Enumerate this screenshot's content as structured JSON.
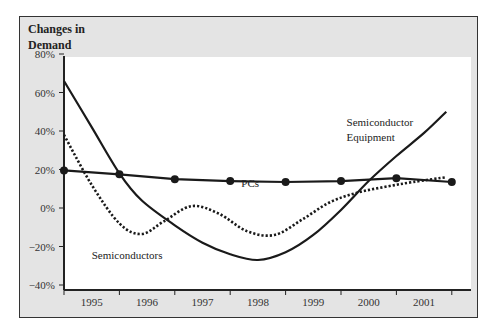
{
  "chart_data": {
    "type": "line",
    "title": "",
    "ylabel_lines": [
      "Changes in",
      "Demand"
    ],
    "xlabel": "",
    "ylim": [
      -40,
      80
    ],
    "yticks": [
      80,
      60,
      40,
      20,
      0,
      -20,
      -40
    ],
    "ytick_labels": [
      "80%",
      "60%",
      "40%",
      "20%",
      "0%",
      "-20%",
      "-40%"
    ],
    "categories": [
      "1995",
      "1996",
      "1997",
      "1998",
      "1999",
      "2000",
      "2001"
    ],
    "grid": false,
    "legend": "inline labels",
    "series": [
      {
        "name": "PCs",
        "style": "solid-with-markers",
        "x": [
          1995.0,
          1996.0,
          1997.0,
          1998.0,
          1999.0,
          2000.0,
          2001.0,
          2002.0
        ],
        "values": [
          19.5,
          17.5,
          15,
          14,
          13.5,
          14,
          15.5,
          13.5
        ]
      },
      {
        "name": "Semiconductor Equipment",
        "style": "solid",
        "x": [
          1995.0,
          1995.5,
          1996.0,
          1996.4,
          1997.0,
          1997.5,
          1998.0,
          1998.5,
          1999.0,
          1999.5,
          2000.0,
          2000.5,
          2001.0,
          2001.5,
          2001.9
        ],
        "values": [
          66,
          42,
          18,
          4,
          -9,
          -18,
          -24,
          -27,
          -23,
          -14,
          -1,
          14,
          27,
          39,
          50
        ]
      },
      {
        "name": "Semiconductors",
        "style": "dotted",
        "x": [
          1995.0,
          1995.5,
          1996.0,
          1996.4,
          1996.8,
          1997.3,
          1997.8,
          1998.3,
          1998.8,
          1999.3,
          1999.8,
          2000.3,
          2000.8,
          2001.3,
          2001.9
        ],
        "values": [
          38,
          12,
          -8,
          -13.5,
          -7,
          1,
          -3,
          -12,
          -14,
          -6,
          3,
          8,
          11,
          13.5,
          16
        ]
      }
    ],
    "annotations": [
      {
        "text": "PCs",
        "x": 1998.2,
        "y": 18
      },
      {
        "text": "Semiconductor Equipment",
        "x": 2000.1,
        "y": 50
      },
      {
        "text": "Semiconductors",
        "x": 1995.5,
        "y": -19
      }
    ]
  },
  "colors": {
    "frame_bg": "#e4e4e4",
    "plot_bg": "#ffffff",
    "line": "#1a1a1a"
  }
}
